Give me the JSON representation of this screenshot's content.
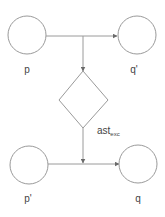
{
  "diagram": {
    "type": "flow",
    "nodes": [
      {
        "id": "p",
        "shape": "circle",
        "label": "p",
        "cx": 27,
        "cy": 35,
        "r": 19,
        "label_x": 27,
        "label_y": 73
      },
      {
        "id": "q_prime",
        "shape": "circle",
        "label": "q'",
        "cx": 137,
        "cy": 35,
        "r": 19,
        "label_x": 134,
        "label_y": 73
      },
      {
        "id": "decision",
        "shape": "diamond",
        "label": "",
        "cx": 83,
        "cy": 100
      },
      {
        "id": "p_prime",
        "shape": "circle",
        "label": "p'",
        "cx": 29,
        "cy": 165,
        "r": 19,
        "label_x": 28,
        "label_y": 202
      },
      {
        "id": "q",
        "shape": "circle",
        "label": "q",
        "cx": 138,
        "cy": 164,
        "r": 19,
        "label_x": 138,
        "label_y": 202
      }
    ],
    "edges": [
      {
        "from": "p",
        "to": "q_prime"
      },
      {
        "from": "p_q_prime_junction",
        "to": "decision"
      },
      {
        "from": "decision",
        "to": "p_prime_q_junction",
        "label": "ast",
        "label_sub": "exc"
      },
      {
        "from": "p_prime",
        "to": "q"
      }
    ],
    "edge_label": {
      "main": "ast",
      "sub": "exc"
    },
    "colors": {
      "line": "#9a9a9a",
      "text": "#444444",
      "background": "#ffffff"
    }
  }
}
